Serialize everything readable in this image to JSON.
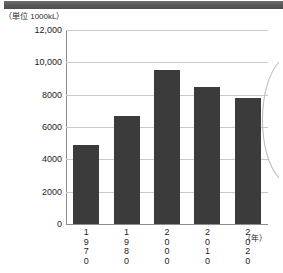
{
  "chart_data": {
    "type": "bar",
    "title": "",
    "subtitle": "",
    "unit_caption": "（単位 1000kL）",
    "xlabel": "（年）",
    "ylabel": "",
    "categories": [
      "1970",
      "1980",
      "2000",
      "2010",
      "2020"
    ],
    "values": [
      4900,
      6700,
      9500,
      8500,
      7800
    ],
    "ylim": [
      0,
      12000
    ],
    "ytick_labels": [
      "12,000",
      "10,000",
      "8000",
      "6000",
      "4000",
      "2000",
      "0"
    ],
    "ytick_values": [
      12000,
      10000,
      8000,
      6000,
      4000,
      2000,
      0
    ],
    "grid": true,
    "legend": null,
    "bar_color": "#3b3b3b",
    "grid_color": "#c9c9c9",
    "axis_color": "#8e8e8e"
  },
  "decor": {
    "top_banner_color": "#595959",
    "callout_arc_color": "#b9b9b9"
  }
}
